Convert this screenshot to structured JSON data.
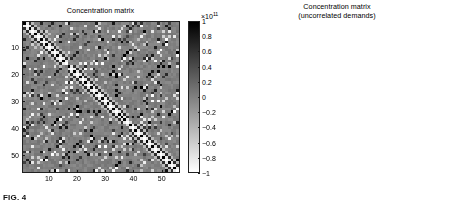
{
  "figure": {
    "caption": "FIG. 4"
  },
  "panels": [
    {
      "id": "left",
      "title": "Concentration matrix",
      "xticks": [
        "10",
        "20",
        "30",
        "40",
        "50"
      ],
      "xtick_values": [
        10,
        20,
        30,
        40,
        50
      ],
      "yticks": [
        "10",
        "20",
        "30",
        "40",
        "50"
      ],
      "ytick_values": [
        10,
        20,
        30,
        40,
        50
      ],
      "colorbar": {
        "exponent_label": "×10",
        "exponent_sup": "11",
        "ticks": [
          "1",
          "0.8",
          "0.6",
          "0.4",
          "0.2",
          "0",
          "-0.2",
          "-0.4",
          "-0.6",
          "-0.8",
          "-1"
        ],
        "tick_values": [
          1,
          0.8,
          0.6,
          0.4,
          0.2,
          0,
          -0.2,
          -0.4,
          -0.6,
          -0.8,
          -1
        ],
        "top_color": "#000000",
        "bottom_color": "#ffffff"
      }
    },
    {
      "id": "right",
      "title": "Concentration matrix\n(uncorrelated demands)",
      "xticks": [
        "10",
        "20",
        "30",
        "40",
        "50"
      ],
      "xtick_values": [
        10,
        20,
        30,
        40,
        50
      ],
      "yticks": [
        "10",
        "20",
        "30",
        "40",
        "50"
      ],
      "ytick_values": [
        10,
        20,
        30,
        40,
        50
      ],
      "colorbar": {
        "exponent_label": "×10",
        "exponent_sup": "11",
        "ticks": [
          "1",
          "0.8",
          "0.6",
          "0.4",
          "0.2",
          "0",
          "-0.2",
          "-0.4",
          "-0.6",
          "-0.8",
          "-1"
        ],
        "tick_values": [
          1,
          0.8,
          0.6,
          0.4,
          0.2,
          0,
          -0.2,
          -0.4,
          -0.6,
          -0.8,
          -1
        ],
        "top_color": "#000000",
        "bottom_color": "#ffffff"
      }
    }
  ],
  "chart_data": [
    {
      "type": "heatmap",
      "panel": "left",
      "title": "Concentration matrix",
      "xlabel": "",
      "ylabel": "",
      "n": 56,
      "xlim": [
        0.5,
        56.5
      ],
      "ylim": [
        0.5,
        56.5
      ],
      "zlim": [
        -100000000000.0,
        100000000000.0
      ],
      "colormap": "gray-reversed (1 = black, -1 = white)",
      "grid": false,
      "legend": "colorbar at right",
      "description": "Dense 56x56 symmetric concentration (inverse covariance) matrix with strong alternating black/white checkerboard structure along the main diagonal and many off-diagonal blocks; mid-gray background near zero.",
      "structure": {
        "background_value": 0.02,
        "diagonal_blocks": [
          {
            "start": 1,
            "end": 16,
            "pattern": "checkerboard",
            "amplitude": 1.0
          },
          {
            "start": 17,
            "end": 38,
            "pattern": "checkerboard",
            "amplitude": 1.0
          },
          {
            "start": 39,
            "end": 56,
            "pattern": "checkerboard",
            "amplitude": 1.0
          }
        ],
        "offdiagonal_density": 0.35,
        "noise_amplitude": 0.1
      }
    },
    {
      "type": "heatmap",
      "panel": "right",
      "title": "Concentration matrix (uncorrelated demands)",
      "xlabel": "",
      "ylabel": "",
      "n": 56,
      "xlim": [
        0.5,
        56.5
      ],
      "ylim": [
        0.5,
        56.5
      ],
      "zlim": [
        -100000000000.0,
        100000000000.0
      ],
      "colormap": "gray-reversed (1 = black, -1 = white)",
      "grid": false,
      "legend": "colorbar at right",
      "description": "Sparse 56x56 concentration matrix: an alternating black/white checkerboard band hugging the main diagonal, with a small number of isolated strong off-diagonal entries; uniform mid-gray elsewhere.",
      "structure": {
        "background_value": 0.02,
        "diagonal_band_halfwidth": 1,
        "isolated_points": [
          [
            11,
            17
          ],
          [
            17,
            11
          ],
          [
            17,
            12
          ],
          [
            12,
            17
          ],
          [
            18,
            22
          ],
          [
            22,
            18
          ],
          [
            20,
            27
          ],
          [
            27,
            20
          ],
          [
            28,
            19
          ],
          [
            19,
            28
          ],
          [
            34,
            18
          ],
          [
            18,
            34
          ],
          [
            37,
            19
          ],
          [
            19,
            37
          ],
          [
            34,
            37
          ],
          [
            37,
            34
          ],
          [
            18,
            23
          ],
          [
            23,
            18
          ],
          [
            52,
            54
          ]
        ],
        "noise_amplitude": 0.03
      }
    }
  ]
}
